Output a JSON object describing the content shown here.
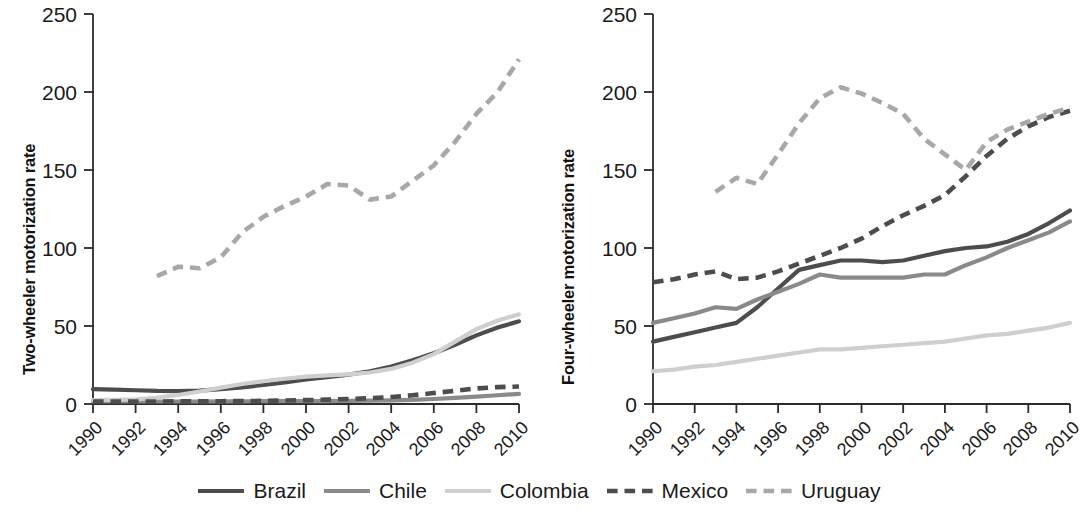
{
  "figure": {
    "background": "#ffffff",
    "panels": [
      "two-wheeler",
      "four-wheeler"
    ]
  },
  "legend": {
    "position": "bottom-center",
    "entries": [
      {
        "name": "Brazil",
        "label": "Brazil",
        "color": "#4d4d4d",
        "style": "solid",
        "width": 4.2
      },
      {
        "name": "Chile",
        "label": "Chile",
        "color": "#8a8a8a",
        "style": "solid",
        "width": 4.2
      },
      {
        "name": "Colombia",
        "label": "Colombia",
        "color": "#cfcfcf",
        "style": "solid",
        "width": 4.2
      },
      {
        "name": "Mexico",
        "label": "Mexico",
        "color": "#4d4d4d",
        "style": "dashed",
        "width": 4.6
      },
      {
        "name": "Uruguay",
        "label": "Uruguay",
        "color": "#a8a8a8",
        "style": "dashed",
        "width": 4.6
      }
    ]
  },
  "chart_data": [
    {
      "type": "line",
      "panel": "left",
      "title": "",
      "xlabel": "",
      "ylabel": "Two-wheeler motorization rate",
      "x": [
        1990,
        1991,
        1992,
        1993,
        1994,
        1995,
        1996,
        1997,
        1998,
        1999,
        2000,
        2001,
        2002,
        2003,
        2004,
        2005,
        2006,
        2007,
        2008,
        2009,
        2010
      ],
      "xticks": [
        1990,
        1992,
        1994,
        1996,
        1998,
        2000,
        2002,
        2004,
        2006,
        2008,
        2010
      ],
      "xticklabels": [
        "1990",
        "1992",
        "1994",
        "1996",
        "1998",
        "2000",
        "2002",
        "2004",
        "2006",
        "2008",
        "2010"
      ],
      "yticks": [
        0,
        50,
        100,
        150,
        200,
        250
      ],
      "yticklabels": [
        "0",
        "50",
        "100",
        "150",
        "200",
        "250"
      ],
      "xlim": [
        1990,
        2010
      ],
      "ylim": [
        0,
        250
      ],
      "grid": false,
      "series": [
        {
          "name": "Brazil",
          "color": "#4d4d4d",
          "style": "solid",
          "values": [
            9.5,
            9.2,
            8.8,
            8.4,
            8.3,
            8.6,
            9.5,
            10.7,
            12.2,
            13.9,
            15.8,
            17.2,
            18.8,
            21.0,
            24.0,
            28.0,
            32.5,
            38.0,
            44.0,
            49.0,
            53.0
          ]
        },
        {
          "name": "Chile",
          "color": "#8a8a8a",
          "style": "solid",
          "values": [
            1.6,
            1.6,
            1.6,
            1.6,
            1.6,
            1.6,
            1.7,
            1.7,
            1.8,
            1.8,
            1.9,
            1.9,
            2.0,
            2.1,
            2.3,
            2.7,
            3.2,
            3.9,
            4.7,
            5.6,
            6.5
          ]
        },
        {
          "name": "Colombia",
          "color": "#cfcfcf",
          "style": "solid",
          "values": [
            2.5,
            2.6,
            3.0,
            4.0,
            5.8,
            8.0,
            10.5,
            12.8,
            14.6,
            16.2,
            17.6,
            18.4,
            19.0,
            20.2,
            22.5,
            26.5,
            32.0,
            40.0,
            48.0,
            53.5,
            57.5
          ]
        },
        {
          "name": "Mexico",
          "color": "#4d4d4d",
          "style": "dashed",
          "values": [
            1.5,
            1.5,
            1.6,
            1.6,
            1.7,
            1.7,
            1.8,
            1.9,
            2.0,
            2.2,
            2.5,
            2.8,
            3.2,
            3.7,
            4.5,
            5.6,
            7.0,
            8.5,
            10.0,
            10.8,
            11.2
          ]
        },
        {
          "name": "Uruguay",
          "color": "#a8a8a8",
          "style": "dashed",
          "values": [
            null,
            null,
            null,
            82,
            88,
            87,
            94,
            110,
            120,
            127,
            133,
            141,
            140,
            131,
            133,
            143,
            153,
            168,
            186,
            200,
            221
          ]
        }
      ]
    },
    {
      "type": "line",
      "panel": "right",
      "title": "",
      "xlabel": "",
      "ylabel": "Four-wheeler motorization rate",
      "x": [
        1990,
        1991,
        1992,
        1993,
        1994,
        1995,
        1996,
        1997,
        1998,
        1999,
        2000,
        2001,
        2002,
        2003,
        2004,
        2005,
        2006,
        2007,
        2008,
        2009,
        2010
      ],
      "xticks": [
        1990,
        1992,
        1994,
        1996,
        1998,
        2000,
        2002,
        2004,
        2006,
        2008,
        2010
      ],
      "xticklabels": [
        "1990",
        "1992",
        "1994",
        "1996",
        "1998",
        "2000",
        "2002",
        "2004",
        "2006",
        "2008",
        "2010"
      ],
      "yticks": [
        0,
        50,
        100,
        150,
        200,
        250
      ],
      "yticklabels": [
        "0",
        "50",
        "100",
        "150",
        "200",
        "250"
      ],
      "xlim": [
        1990,
        2010
      ],
      "ylim": [
        0,
        250
      ],
      "grid": false,
      "series": [
        {
          "name": "Brazil",
          "color": "#4d4d4d",
          "style": "solid",
          "values": [
            40,
            43,
            46,
            49,
            52,
            62,
            74,
            86,
            89,
            92,
            92,
            91,
            92,
            95,
            98,
            100,
            101,
            104,
            109,
            116,
            124
          ]
        },
        {
          "name": "Chile",
          "color": "#8a8a8a",
          "style": "solid",
          "values": [
            52,
            55,
            58,
            62,
            61,
            67,
            72,
            77,
            83,
            81,
            81,
            81,
            81,
            83,
            83,
            89,
            94,
            100,
            105,
            110,
            117
          ]
        },
        {
          "name": "Colombia",
          "color": "#cfcfcf",
          "style": "solid",
          "values": [
            21,
            22,
            24,
            25,
            27,
            29,
            31,
            33,
            35,
            35,
            36,
            37,
            38,
            39,
            40,
            42,
            44,
            45,
            47,
            49,
            52
          ]
        },
        {
          "name": "Mexico",
          "color": "#4d4d4d",
          "style": "dashed",
          "values": [
            78,
            80,
            83,
            85,
            80,
            81,
            85,
            90,
            95,
            100,
            106,
            114,
            121,
            127,
            134,
            146,
            159,
            170,
            178,
            184,
            188
          ]
        },
        {
          "name": "Uruguay",
          "color": "#a8a8a8",
          "style": "dashed",
          "values": [
            null,
            null,
            null,
            136,
            145,
            141,
            160,
            180,
            196,
            203,
            199,
            193,
            186,
            170,
            160,
            150,
            168,
            176,
            181,
            186,
            190
          ]
        }
      ]
    }
  ]
}
